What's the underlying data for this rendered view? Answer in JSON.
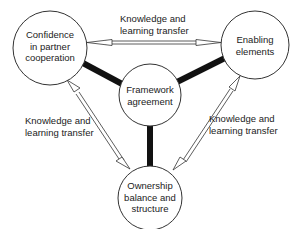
{
  "diagram": {
    "nodes": [
      {
        "id": "confidence",
        "lines": [
          "Confidence",
          "in partner",
          "cooperation"
        ]
      },
      {
        "id": "enabling",
        "lines": [
          "Enabling",
          "elements"
        ]
      },
      {
        "id": "framework",
        "lines": [
          "Framework",
          "agreement"
        ]
      },
      {
        "id": "ownership",
        "lines": [
          "Ownership",
          "balance and",
          "structure"
        ]
      }
    ],
    "edge_labels": {
      "top": [
        "Knowledge and",
        "learning transfer"
      ],
      "left": [
        "Knowledge and",
        "learning transfer"
      ],
      "right": [
        "Knowledge and",
        "learning transfer"
      ]
    },
    "edges": [
      {
        "from": "confidence",
        "to": "enabling",
        "type": "double-arrow",
        "label": "Knowledge and learning transfer"
      },
      {
        "from": "confidence",
        "to": "ownership",
        "type": "double-arrow",
        "label": "Knowledge and learning transfer"
      },
      {
        "from": "enabling",
        "to": "ownership",
        "type": "double-arrow",
        "label": "Knowledge and learning transfer"
      },
      {
        "from": "framework",
        "to": "confidence",
        "type": "thick-line"
      },
      {
        "from": "framework",
        "to": "enabling",
        "type": "thick-line"
      },
      {
        "from": "framework",
        "to": "ownership",
        "type": "thick-line"
      }
    ],
    "colors": {
      "stroke": "#222222",
      "background": "#ffffff"
    }
  }
}
